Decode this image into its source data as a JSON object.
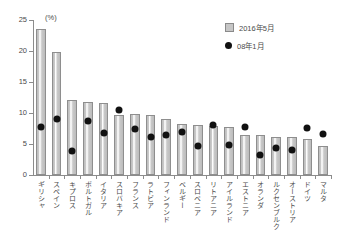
{
  "chart_data": {
    "type": "bar",
    "title": "",
    "xlabel": "",
    "ylabel": "",
    "unit_label": "(%)",
    "ylim": [
      0,
      25
    ],
    "yticks": [
      0,
      5,
      10,
      15,
      20,
      25
    ],
    "grid": false,
    "legend_position": "top-right",
    "categories": [
      "ギリシャ",
      "スペイン",
      "キプロス",
      "ポルトガル",
      "イタリア",
      "スロバキア",
      "フランス",
      "ラトビア",
      "フィンランド",
      "ベルギー",
      "スロベニア",
      "リトアニア",
      "アイルランド",
      "エストニア",
      "オランダ",
      "ルクセンブルク",
      "オーストリア",
      "ドイツ",
      "マルタ"
    ],
    "series": [
      {
        "name": "2016年5月",
        "kind": "bar",
        "color": "#c6c6c6",
        "values": [
          23.5,
          19.8,
          12.1,
          11.7,
          11.6,
          9.7,
          9.9,
          9.6,
          9.0,
          8.2,
          8.0,
          7.9,
          7.8,
          6.5,
          6.4,
          6.2,
          6.1,
          5.8,
          4.6
        ]
      },
      {
        "name": "08年1月",
        "kind": "point",
        "color": "#111111",
        "values": [
          7.8,
          9.0,
          3.9,
          8.7,
          6.7,
          10.5,
          7.4,
          6.2,
          6.5,
          7.0,
          4.6,
          8.0,
          4.9,
          7.7,
          3.3,
          4.4,
          4.0,
          7.6,
          6.6
        ]
      }
    ]
  },
  "legend": [
    {
      "label": "2016年5月",
      "marker": "bar-swatch"
    },
    {
      "label": "08年1月",
      "marker": "dot-swatch"
    }
  ]
}
